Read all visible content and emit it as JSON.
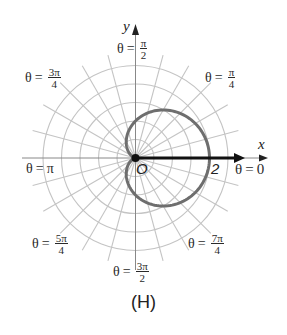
{
  "figure": {
    "caption": "(H)",
    "axis_x_label": "x",
    "axis_y_label": "y",
    "origin_label": "O",
    "tick_label_2": "2",
    "angle_labels": {
      "theta_0": {
        "prefix": "θ",
        "eq": "=",
        "value": "0"
      },
      "theta_pi_4": {
        "prefix": "θ",
        "eq": "=",
        "num": "π",
        "den": "4"
      },
      "theta_pi_2": {
        "prefix": "θ",
        "eq": "=",
        "num": "π",
        "den": "2"
      },
      "theta_3pi_4": {
        "prefix": "θ",
        "eq": "=",
        "num": "3π",
        "den": "4"
      },
      "theta_pi": {
        "prefix": "θ",
        "eq": "=",
        "value": "π"
      },
      "theta_5pi_4": {
        "prefix": "θ",
        "eq": "=",
        "num": "5π",
        "den": "4"
      },
      "theta_3pi_2": {
        "prefix": "θ",
        "eq": "=",
        "num": "3π",
        "den": "2"
      },
      "theta_7pi_4": {
        "prefix": "θ",
        "eq": "=",
        "num": "7π",
        "den": "4"
      }
    },
    "colors": {
      "grid": "#c4c4c4",
      "curve": "#6e6e6e",
      "axis": "#111111"
    }
  },
  "chart_data": {
    "type": "polar",
    "title": "(H)",
    "curve": "r = 1 + cos θ",
    "curve_type": "cardioid",
    "grid": {
      "rings": [
        0.5,
        1,
        1.5,
        2,
        2.5
      ],
      "radial_step_degrees": 15
    },
    "key_points": [
      {
        "theta": "0",
        "r": 2
      },
      {
        "theta": "π/2",
        "r": 1
      },
      {
        "theta": "π",
        "r": 0
      },
      {
        "theta": "3π/2",
        "r": 1
      }
    ],
    "angle_labels": [
      "θ = 0",
      "θ = π/4",
      "θ = π/2",
      "θ = 3π/4",
      "θ = π",
      "θ = 5π/4",
      "θ = 3π/2",
      "θ = 7π/4"
    ],
    "xlabel": "x",
    "ylabel": "y",
    "annotations": [
      "O",
      "2"
    ],
    "highlighted_ray": {
      "theta": 0,
      "from_r": 0,
      "to_r": 2.9
    }
  }
}
